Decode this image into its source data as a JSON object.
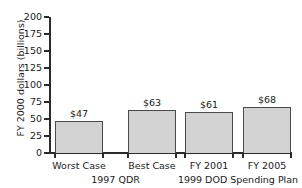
{
  "chart_data": {
    "type": "bar",
    "title": "",
    "xlabel": "",
    "ylabel": "FY 2000 dollars (billions)",
    "categories": [
      "Worst Case",
      "Best Case",
      "FY 2001",
      "FY 2005"
    ],
    "values": [
      47,
      63,
      61,
      68
    ],
    "data_labels": [
      "$47",
      "$63",
      "$61",
      "$68"
    ],
    "ylim": [
      0,
      200
    ],
    "yticks": [
      0,
      25,
      50,
      75,
      100,
      125,
      150,
      175,
      200
    ],
    "ytick_labels": [
      "0",
      "25",
      "50",
      "75",
      "100",
      "125",
      "150",
      "175",
      "200"
    ],
    "grid": false,
    "legend": null,
    "groups": [
      {
        "label": "1997 QDR",
        "categories": [
          "Worst Case",
          "Best Case"
        ]
      },
      {
        "label": "1999 DOD Spending Plan",
        "categories": [
          "FY 2001",
          "FY 2005"
        ]
      }
    ],
    "colors": {
      "bar_fill": "#d3d3d3",
      "bar_edge": "#4a4a4a",
      "axis": "#2b2b2b",
      "text": "#1a1a1a",
      "background": "#ffffff"
    }
  }
}
